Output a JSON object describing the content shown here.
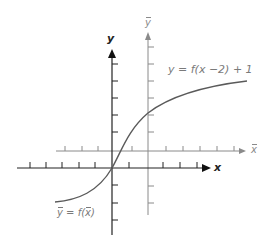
{
  "figure": {
    "axes": {
      "xy": {
        "x_label": "x",
        "y_label": "y",
        "color": "#222222",
        "origin_px": [
          112,
          168
        ],
        "tick_spacing_px": 17
      },
      "bar": {
        "x_label": "x",
        "y_label": "y",
        "color": "#8a8a8a",
        "origin_px": [
          148,
          151
        ],
        "tick_spacing_px": 17
      }
    },
    "labels": {
      "curve_xy": "y = f(x −2) + 1",
      "curve_bar_lhs": "y",
      "curve_bar_eq": " = f(",
      "curve_bar_arg": "x",
      "curve_bar_close": ")"
    },
    "colors": {
      "curve": "#5a5a5a",
      "primary_axes": "#222222",
      "translated_axes": "#8a8a8a"
    }
  }
}
